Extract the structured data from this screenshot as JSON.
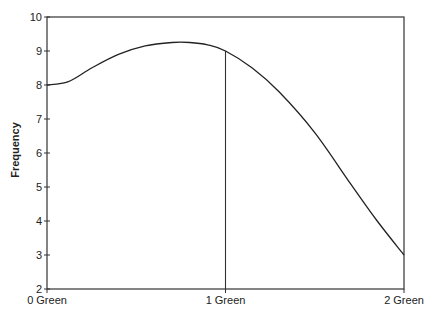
{
  "chart_data": {
    "type": "line",
    "title": "",
    "xlabel": "",
    "ylabel": "Frequency",
    "ylim": [
      2,
      10
    ],
    "yticks": [
      2,
      3,
      4,
      5,
      6,
      7,
      8,
      9,
      10
    ],
    "xlim": [
      0,
      2
    ],
    "xticks": [
      {
        "value": 0,
        "label": "0 Green"
      },
      {
        "value": 1,
        "label": "1 Green"
      },
      {
        "value": 2,
        "label": "2 Green"
      }
    ],
    "grid": false,
    "legend": null,
    "series": [
      {
        "name": "Frequency curve",
        "x": [
          0,
          0.12,
          0.25,
          0.4,
          0.55,
          0.7,
          0.8,
          0.9,
          1.0,
          1.15,
          1.3,
          1.5,
          1.7,
          1.85,
          2.0
        ],
        "y": [
          8.0,
          8.1,
          8.5,
          8.9,
          9.15,
          9.25,
          9.25,
          9.18,
          9.0,
          8.5,
          7.8,
          6.6,
          5.1,
          4.0,
          3.0
        ]
      }
    ],
    "annotations": [
      {
        "type": "vertical_line",
        "x": 1,
        "from_y": 2,
        "to_y": 9.0
      }
    ]
  }
}
